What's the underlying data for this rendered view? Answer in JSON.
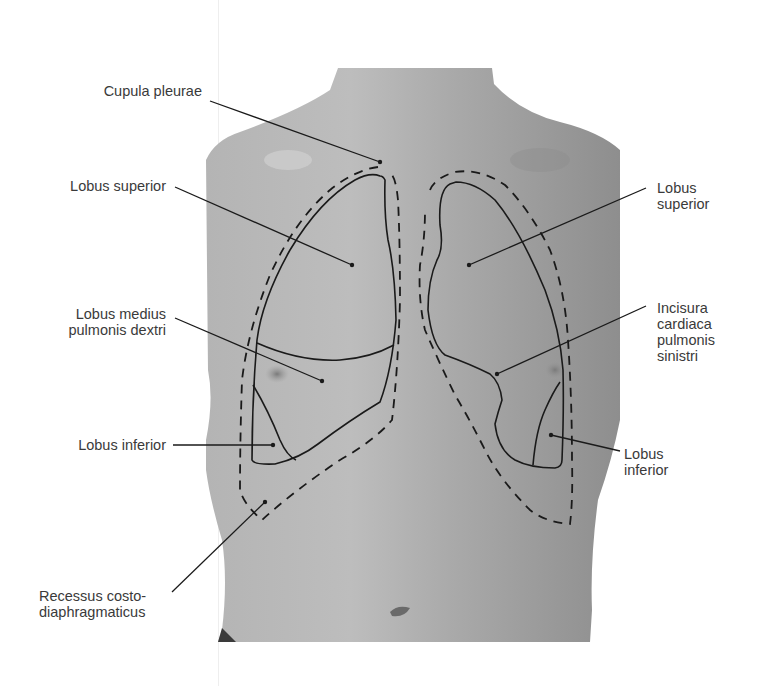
{
  "figure": {
    "type": "anatomical-illustration",
    "colors": {
      "skin": "#a8a8a8",
      "outline": "#1a1a1a",
      "label_text": "#3a3a3a",
      "background": "#ffffff"
    }
  },
  "labels": {
    "cupula_pleurae": "Cupula pleurae",
    "lobus_superior_right": "Lobus superior",
    "lobus_medius": "Lobus medius\npulmonis dextri",
    "lobus_inferior_right": "Lobus inferior",
    "recessus": "Recessus costo-\ndiaphragmaticus",
    "lobus_superior_left": "Lobus\nsuperior",
    "incisura_cardiaca": "Incisura\ncardiaca\npulmonis\nsinistri",
    "lobus_inferior_left": "Lobus\ninferior"
  }
}
